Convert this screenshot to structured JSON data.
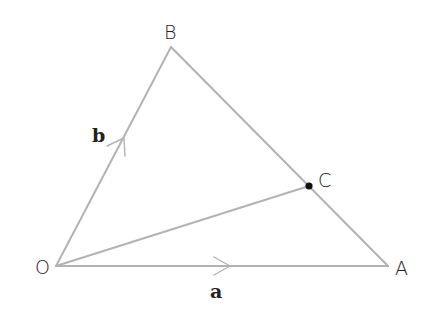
{
  "diagram": {
    "type": "vector-triangle",
    "colors": {
      "line": "#b3b3b3",
      "text": "#222222",
      "point": "#111111",
      "background": "#ffffff"
    },
    "points": {
      "O": {
        "label": "O",
        "x": 56,
        "y": 266
      },
      "A": {
        "label": "A",
        "x": 388,
        "y": 266
      },
      "B": {
        "label": "B",
        "x": 171,
        "y": 47
      },
      "C": {
        "label": "C",
        "x": 309,
        "y": 186,
        "marked": true,
        "on_segment": "AB"
      }
    },
    "segments": [
      {
        "from": "O",
        "to": "A",
        "vector_label": "a",
        "has_arrow": true
      },
      {
        "from": "O",
        "to": "B",
        "vector_label": "b",
        "has_arrow": true
      },
      {
        "from": "A",
        "to": "B",
        "has_arrow": false
      },
      {
        "from": "O",
        "to": "C",
        "has_arrow": false
      }
    ],
    "labels": {
      "O": "O",
      "A": "A",
      "B": "B",
      "C": "C",
      "a": "a",
      "b": "b"
    }
  }
}
